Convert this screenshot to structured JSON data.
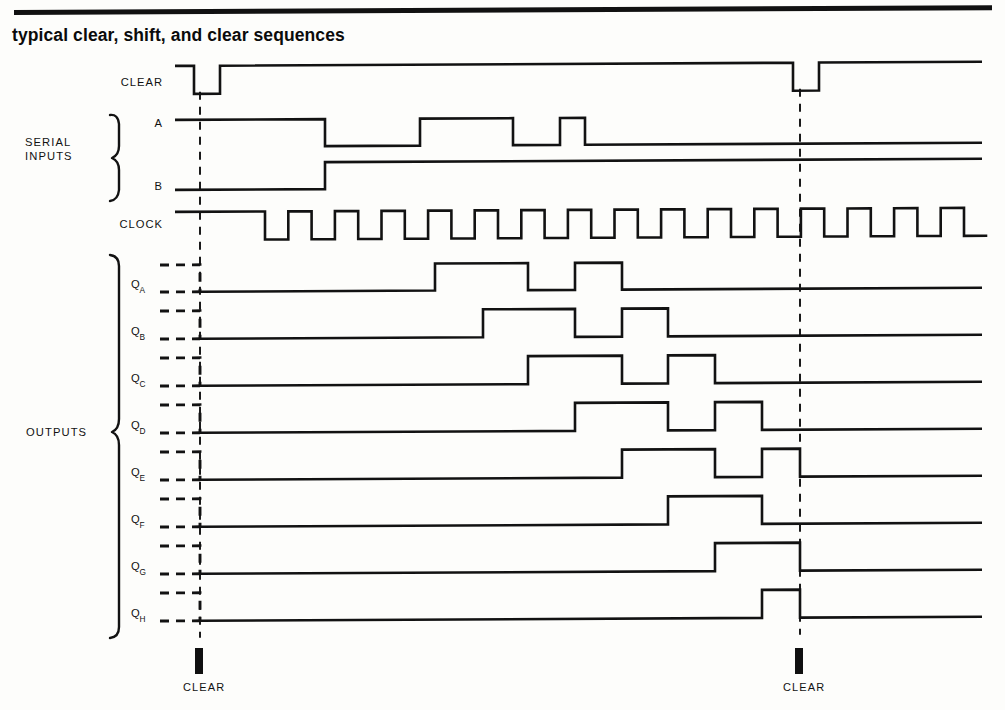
{
  "figure": {
    "title": "typical clear, shift, and clear sequences",
    "colors": {
      "ink": "#121212",
      "background": "#fdfdfb"
    }
  },
  "groups": [
    {
      "id": "serial-inputs",
      "label_line1": "SERIAL",
      "label_line2": "INPUTS",
      "label": "SERIAL INPUTS"
    },
    {
      "id": "outputs",
      "label_line1": "OUTPUTS",
      "label_line2": "",
      "label": "OUTPUTS"
    }
  ],
  "markers": [
    {
      "id": "clear-marker-1",
      "label": "CLEAR",
      "x": 200
    },
    {
      "id": "clear-marker-2",
      "label": "CLEAR",
      "x": 800
    }
  ],
  "guides": [
    {
      "id": "guide-clear-1",
      "x": 200,
      "y1": 92,
      "y2": 638
    },
    {
      "id": "guide-clear-2",
      "x": 800,
      "y1": 92,
      "y2": 638
    }
  ],
  "signals": [
    {
      "id": "clear",
      "label": "CLEAR",
      "sub": "",
      "row_y": 86,
      "high_y": 66,
      "low_y": 94,
      "start_x": 175,
      "end_x": 982,
      "initial": 1,
      "dashed_prefix": false,
      "transitions": [
        194,
        220,
        793,
        819
      ]
    },
    {
      "id": "a",
      "label": "A",
      "sub": "",
      "row_y": 127,
      "high_y": 120,
      "low_y": 147,
      "start_x": 175,
      "end_x": 982,
      "initial": 1,
      "dashed_prefix": false,
      "transitions": [
        325,
        420,
        513,
        560,
        585
      ]
    },
    {
      "id": "b",
      "label": "B",
      "sub": "",
      "row_y": 190,
      "high_y": 163,
      "low_y": 190,
      "start_x": 175,
      "end_x": 982,
      "initial": 0,
      "dashed_prefix": false,
      "transitions": [
        325
      ]
    },
    {
      "id": "clock",
      "label": "CLOCK",
      "sub": "",
      "row_y": 228,
      "high_y": 212,
      "low_y": 240,
      "start_x": 175,
      "end_x": 982,
      "initial": 1,
      "dashed_prefix": false,
      "clock": {
        "first_fall": 265,
        "period": 46.6,
        "duty": 0.5,
        "count": 16
      }
    },
    {
      "id": "qa",
      "label": "Q",
      "sub": "A",
      "row_y": 288,
      "high_y": 265,
      "low_y": 292,
      "start_x": 200,
      "end_x": 982,
      "initial": 0,
      "dashed_prefix": true,
      "dash_start_x": 160,
      "transitions": [
        435,
        528,
        575,
        622
      ]
    },
    {
      "id": "qb",
      "label": "Q",
      "sub": "B",
      "row_y": 335,
      "high_y": 311,
      "low_y": 339,
      "start_x": 200,
      "end_x": 982,
      "initial": 0,
      "dashed_prefix": true,
      "dash_start_x": 160,
      "transitions": [
        483,
        575,
        622,
        668
      ]
    },
    {
      "id": "qc",
      "label": "Q",
      "sub": "C",
      "row_y": 382,
      "high_y": 358,
      "low_y": 386,
      "start_x": 200,
      "end_x": 982,
      "initial": 0,
      "dashed_prefix": true,
      "dash_start_x": 160,
      "transitions": [
        528,
        622,
        668,
        715
      ]
    },
    {
      "id": "qd",
      "label": "Q",
      "sub": "D",
      "row_y": 429,
      "high_y": 405,
      "low_y": 433,
      "start_x": 200,
      "end_x": 982,
      "initial": 0,
      "dashed_prefix": true,
      "dash_start_x": 160,
      "transitions": [
        575,
        668,
        715,
        762
      ]
    },
    {
      "id": "qe",
      "label": "Q",
      "sub": "E",
      "row_y": 476,
      "high_y": 452,
      "low_y": 480,
      "start_x": 200,
      "end_x": 982,
      "initial": 0,
      "dashed_prefix": true,
      "dash_start_x": 160,
      "transitions": [
        622,
        715,
        762,
        800
      ]
    },
    {
      "id": "qf",
      "label": "Q",
      "sub": "F",
      "row_y": 523,
      "high_y": 499,
      "low_y": 527,
      "start_x": 200,
      "end_x": 982,
      "initial": 0,
      "dashed_prefix": true,
      "dash_start_x": 160,
      "transitions": [
        668,
        762
      ]
    },
    {
      "id": "qg",
      "label": "Q",
      "sub": "G",
      "row_y": 570,
      "high_y": 546,
      "low_y": 574,
      "start_x": 200,
      "end_x": 982,
      "initial": 0,
      "dashed_prefix": true,
      "dash_start_x": 160,
      "transitions": [
        715,
        800
      ]
    },
    {
      "id": "qh",
      "label": "Q",
      "sub": "H",
      "row_y": 617,
      "high_y": 593,
      "low_y": 621,
      "start_x": 200,
      "end_x": 982,
      "initial": 0,
      "dashed_prefix": true,
      "dash_start_x": 160,
      "transitions": [
        762,
        800
      ]
    }
  ],
  "chart_data": {
    "type": "line",
    "title": "typical clear, shift, and clear sequences",
    "xlabel": "",
    "ylabel": "",
    "series": [
      {
        "name": "CLEAR",
        "levels": "high, low pulse at first CLEAR, high, low pulse at second CLEAR, high"
      },
      {
        "name": "A",
        "levels": "high, low, high, low, narrow high pulse, low"
      },
      {
        "name": "B",
        "levels": "low, high"
      },
      {
        "name": "CLOCK",
        "levels": "16 square pulses after an initial high interval"
      },
      {
        "name": "QA",
        "levels": "cleared low, high, low, high, low"
      },
      {
        "name": "QB",
        "levels": "cleared low, high, low, high, low"
      },
      {
        "name": "QC",
        "levels": "cleared low, high, low, high, low"
      },
      {
        "name": "QD",
        "levels": "cleared low, high, low, high, low"
      },
      {
        "name": "QE",
        "levels": "cleared low, high, low, high, cleared low"
      },
      {
        "name": "QF",
        "levels": "cleared low, high, low"
      },
      {
        "name": "QG",
        "levels": "cleared low, high, cleared low"
      },
      {
        "name": "QH",
        "levels": "cleared low, high, cleared low"
      }
    ],
    "annotations": [
      "CLEAR",
      "CLEAR",
      "SERIAL INPUTS",
      "OUTPUTS"
    ]
  }
}
